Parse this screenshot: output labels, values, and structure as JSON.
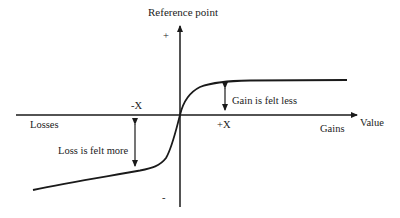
{
  "diagram": {
    "title": "Reference point",
    "y_plus": "+",
    "y_minus": "-",
    "x_axis_label": "Value",
    "left_label": "Losses",
    "right_label": "Gains",
    "neg_x": "-X",
    "pos_x": "+X",
    "gain_annotation": "Gain is felt less",
    "loss_annotation": "Loss is felt more"
  },
  "colors": {
    "line": "#1a1a1a",
    "background": "#ffffff"
  }
}
